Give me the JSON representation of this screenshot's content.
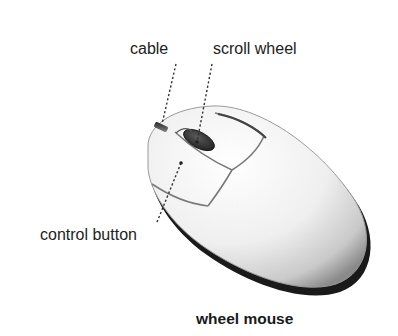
{
  "labels": {
    "cable": "cable",
    "scroll_wheel": "scroll wheel",
    "control_button": "control button"
  },
  "caption": "wheel mouse",
  "illustration": {
    "subject": "computer mouse",
    "body_color": "#f2f2f2",
    "wheel_color": "#3a3a3a",
    "leader_line_style": "dotted"
  }
}
